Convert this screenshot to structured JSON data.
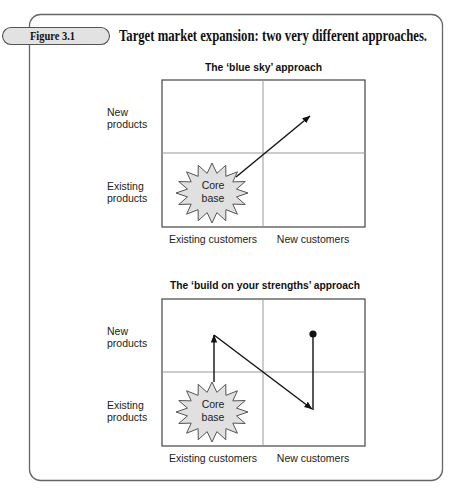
{
  "figure": {
    "label": "Figure 3.1",
    "title": "Target market expansion: two very different approaches."
  },
  "diagrams": [
    {
      "title": "The ‘blue sky’ approach",
      "rows": [
        {
          "line1": "New",
          "line2": "products"
        },
        {
          "line1": "Existing",
          "line2": "products"
        }
      ],
      "columns": [
        "Existing customers",
        "New customers"
      ],
      "core": {
        "line1": "Core",
        "line2": "base"
      },
      "arrows": [
        {
          "from": "existing-products/existing-customers",
          "to": "new-products/new-customers",
          "style": "single diagonal arrow"
        }
      ]
    },
    {
      "title": "The ‘build on your strengths’ approach",
      "rows": [
        {
          "line1": "New",
          "line2": "products"
        },
        {
          "line1": "Existing",
          "line2": "products"
        }
      ],
      "columns": [
        "Existing customers",
        "New customers"
      ],
      "core": {
        "line1": "Core",
        "line2": "base"
      },
      "arrows": [
        {
          "from": "existing-products/existing-customers",
          "to": "new-products/existing-customers",
          "style": "vertical arrow"
        },
        {
          "from": "new-products/existing-customers",
          "to": "existing-products/new-customers",
          "style": "diagonal arrow"
        },
        {
          "from": "existing-products/new-customers",
          "to": "new-products/new-customers",
          "style": "vertical line ending in dot"
        }
      ]
    }
  ],
  "colors": {
    "frame": "#666666",
    "label_fill": "#e2e2e2",
    "star_fill": "#e0e0e0",
    "arrow": "#111111",
    "grid_outer": "#444444",
    "grid_inner": "#999999"
  }
}
